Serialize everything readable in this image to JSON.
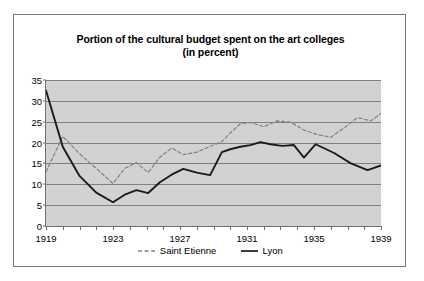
{
  "chart_data": {
    "type": "line",
    "title": "Portion of the cultural budget spent on the art colleges",
    "subtitle": "(in percent)",
    "xlabel": "",
    "ylabel": "",
    "xlim": [
      1919,
      1939
    ],
    "ylim": [
      0,
      35
    ],
    "yticks": [
      0,
      5,
      10,
      15,
      20,
      25,
      30,
      35
    ],
    "ytick_labels": [
      "0",
      "5",
      "10",
      "15",
      "20",
      "25",
      "30",
      "35"
    ],
    "x": [
      1919,
      1919.8,
      1920.6,
      1921.4,
      1922.2,
      1923,
      1923.8,
      1924.6,
      1925.4,
      1926.2,
      1927,
      1927.8,
      1928.6,
      1929.4,
      1930.2,
      1931,
      1931.8,
      1932.6,
      1933.4,
      1934.2,
      1935,
      1935.8,
      1936.6,
      1937.4,
      1938.2,
      1939
    ],
    "xticks": [
      1919,
      1920,
      1921,
      1922,
      1923,
      1924,
      1925,
      1926,
      1927,
      1928,
      1929,
      1930,
      1931,
      1932,
      1933,
      1934,
      1935,
      1936,
      1937,
      1938,
      1939
    ],
    "xtick_labels": [
      "1919",
      "",
      "",
      "",
      "1923",
      "",
      "",
      "",
      "1927",
      "",
      "",
      "",
      "1931",
      "",
      "",
      "",
      "1935",
      "",
      "",
      "",
      "1939"
    ],
    "grid": "horizontal",
    "legend_position": "bottom-center",
    "plot_background": "#d2d2d2",
    "gridline_color": "#808080",
    "series": [
      {
        "name": "Saint Etienne",
        "style": "dashed",
        "color": "#808080",
        "points": [
          [
            1919,
            13.0
          ],
          [
            1920,
            21.5
          ],
          [
            1921,
            17.3
          ],
          [
            1922,
            13.8
          ],
          [
            1923,
            10.2
          ],
          [
            1923.7,
            13.8
          ],
          [
            1924.4,
            15.2
          ],
          [
            1925.1,
            12.8
          ],
          [
            1925.8,
            16.5
          ],
          [
            1926.5,
            18.7
          ],
          [
            1927.2,
            17.1
          ],
          [
            1928,
            17.7
          ],
          [
            1928.8,
            19.1
          ],
          [
            1929.5,
            20.2
          ],
          [
            1930,
            22.3
          ],
          [
            1930.6,
            24.5
          ],
          [
            1931.2,
            24.8
          ],
          [
            1932,
            23.8
          ],
          [
            1932.8,
            25.2
          ],
          [
            1933.6,
            24.9
          ],
          [
            1934.4,
            23.0
          ],
          [
            1935.2,
            21.9
          ],
          [
            1936,
            21.3
          ],
          [
            1936.8,
            23.5
          ],
          [
            1937.6,
            26.0
          ],
          [
            1938.4,
            25.2
          ],
          [
            1939,
            27.0
          ]
        ]
      },
      {
        "name": "Lyon",
        "style": "solid",
        "color": "#1a1a1a",
        "points": [
          [
            1919,
            32.5
          ],
          [
            1920,
            19.0
          ],
          [
            1921,
            12.0
          ],
          [
            1922,
            8.0
          ],
          [
            1923,
            5.7
          ],
          [
            1923.7,
            7.5
          ],
          [
            1924.4,
            8.6
          ],
          [
            1925.1,
            7.9
          ],
          [
            1925.8,
            10.5
          ],
          [
            1926.5,
            12.3
          ],
          [
            1927.2,
            13.7
          ],
          [
            1928,
            12.8
          ],
          [
            1928.8,
            12.2
          ],
          [
            1929.5,
            17.7
          ],
          [
            1930,
            18.4
          ],
          [
            1930.6,
            19.0
          ],
          [
            1931.2,
            19.4
          ],
          [
            1931.8,
            20.1
          ],
          [
            1932.4,
            19.6
          ],
          [
            1933.1,
            19.2
          ],
          [
            1933.8,
            19.4
          ],
          [
            1934.4,
            16.4
          ],
          [
            1935.1,
            19.6
          ],
          [
            1936.2,
            17.5
          ],
          [
            1937.2,
            15.0
          ],
          [
            1938.2,
            13.4
          ],
          [
            1939,
            14.5
          ]
        ]
      }
    ]
  },
  "legend": {
    "entries": [
      {
        "label": "Saint Etienne"
      },
      {
        "label": "Lyon"
      }
    ]
  }
}
